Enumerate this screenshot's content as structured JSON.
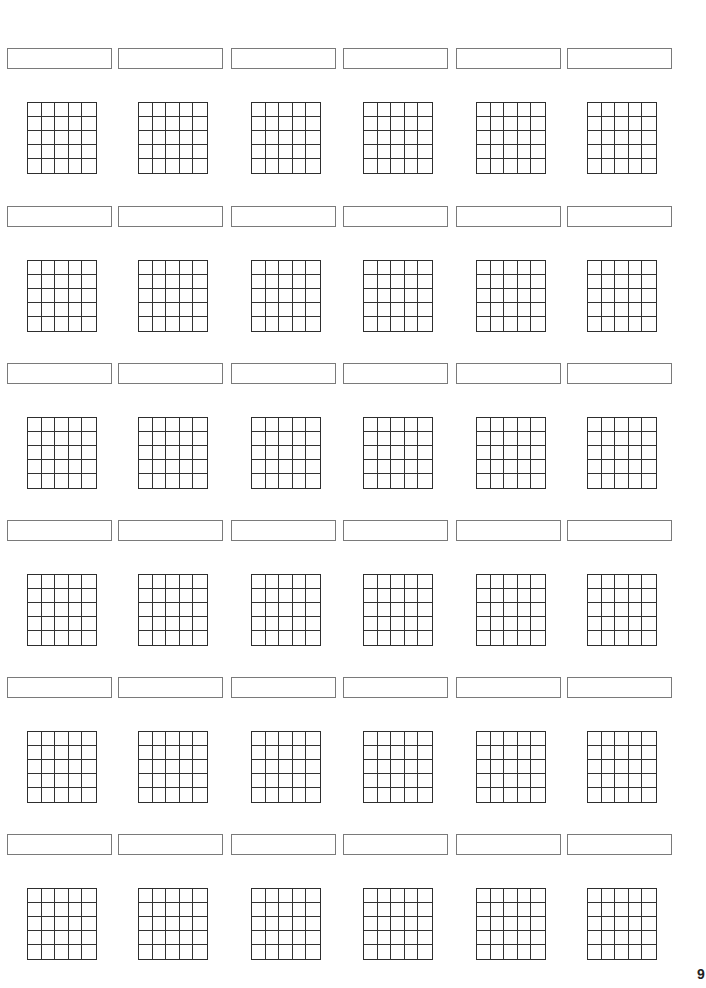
{
  "page": {
    "number": "9"
  },
  "layout": {
    "rows": 6,
    "columns": 6,
    "grid_cells_per_side": 5,
    "column_x": [
      7,
      118,
      231,
      343,
      456,
      567
    ],
    "row_y": [
      48,
      206,
      363,
      520,
      677,
      834
    ]
  },
  "colors": {
    "label_border": "#7a7a7a",
    "grid_line": "#333333",
    "background": "#ffffff"
  },
  "items": [
    {
      "label": "",
      "grid": "5x5"
    },
    {
      "label": "",
      "grid": "5x5"
    },
    {
      "label": "",
      "grid": "5x5"
    },
    {
      "label": "",
      "grid": "5x5"
    },
    {
      "label": "",
      "grid": "5x5"
    },
    {
      "label": "",
      "grid": "5x5"
    },
    {
      "label": "",
      "grid": "5x5"
    },
    {
      "label": "",
      "grid": "5x5"
    },
    {
      "label": "",
      "grid": "5x5"
    },
    {
      "label": "",
      "grid": "5x5"
    },
    {
      "label": "",
      "grid": "5x5"
    },
    {
      "label": "",
      "grid": "5x5"
    },
    {
      "label": "",
      "grid": "5x5"
    },
    {
      "label": "",
      "grid": "5x5"
    },
    {
      "label": "",
      "grid": "5x5"
    },
    {
      "label": "",
      "grid": "5x5"
    },
    {
      "label": "",
      "grid": "5x5"
    },
    {
      "label": "",
      "grid": "5x5"
    },
    {
      "label": "",
      "grid": "5x5"
    },
    {
      "label": "",
      "grid": "5x5"
    },
    {
      "label": "",
      "grid": "5x5"
    },
    {
      "label": "",
      "grid": "5x5"
    },
    {
      "label": "",
      "grid": "5x5"
    },
    {
      "label": "",
      "grid": "5x5"
    },
    {
      "label": "",
      "grid": "5x5"
    },
    {
      "label": "",
      "grid": "5x5"
    },
    {
      "label": "",
      "grid": "5x5"
    },
    {
      "label": "",
      "grid": "5x5"
    },
    {
      "label": "",
      "grid": "5x5"
    },
    {
      "label": "",
      "grid": "5x5"
    },
    {
      "label": "",
      "grid": "5x5"
    },
    {
      "label": "",
      "grid": "5x5"
    },
    {
      "label": "",
      "grid": "5x5"
    },
    {
      "label": "",
      "grid": "5x5"
    },
    {
      "label": "",
      "grid": "5x5"
    },
    {
      "label": "",
      "grid": "5x5"
    }
  ]
}
